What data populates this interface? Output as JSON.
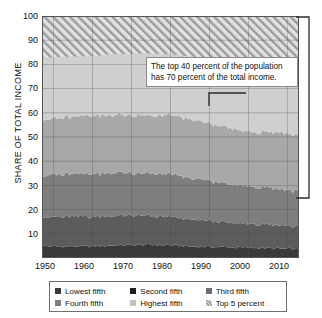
{
  "chart_data": {
    "type": "area",
    "title": "",
    "xlabel": "",
    "ylabel": "SHARE OF TOTAL INCOME",
    "xlim": [
      1947,
      2013
    ],
    "ylim": [
      0,
      100
    ],
    "grid": true,
    "stacked": true,
    "legend_position": "bottom",
    "xticks": [
      1950,
      1960,
      1970,
      1980,
      1990,
      2000,
      2010
    ],
    "yticks": [
      10,
      20,
      30,
      40,
      50,
      60,
      70,
      80,
      90,
      100
    ],
    "x": [
      1947,
      1950,
      1955,
      1960,
      1965,
      1970,
      1975,
      1980,
      1985,
      1990,
      1995,
      2000,
      2005,
      2010,
      2013
    ],
    "series": [
      {
        "name": "Lowest fifth",
        "color": "#3a3a3a",
        "values": [
          5.0,
          4.8,
          4.8,
          4.8,
          5.2,
          5.4,
          5.4,
          5.3,
          4.8,
          4.6,
          4.4,
          4.3,
          4.0,
          3.8,
          3.7
        ]
      },
      {
        "name": "Second fifth",
        "color": "#5c5c5c",
        "values": [
          11.9,
          12.0,
          12.3,
          12.2,
          12.2,
          12.2,
          11.8,
          11.6,
          11.0,
          10.8,
          10.1,
          9.8,
          9.6,
          9.5,
          9.3
        ]
      },
      {
        "name": "Third fifth",
        "color": "#7e7e7e",
        "values": [
          17.0,
          17.4,
          17.8,
          17.8,
          17.8,
          17.6,
          17.6,
          17.6,
          16.9,
          16.6,
          15.8,
          15.4,
          15.3,
          14.8,
          14.6
        ]
      },
      {
        "name": "Fourth fifth",
        "color": "#a8a8a8",
        "values": [
          23.1,
          23.4,
          23.7,
          24.0,
          23.9,
          23.8,
          24.1,
          24.3,
          24.3,
          23.8,
          23.2,
          22.7,
          22.9,
          23.4,
          23.2
        ]
      },
      {
        "name": "Highest fifth",
        "color": "#cfcfcf",
        "values": [
          43.0,
          42.4,
          41.4,
          41.2,
          40.9,
          41.0,
          41.1,
          41.2,
          43.0,
          44.2,
          46.5,
          47.8,
          48.2,
          48.5,
          49.2
        ]
      },
      {
        "name": "Top 5 percent",
        "color": "#d8d8d8",
        "hatched": true,
        "values": [
          17.2,
          17.0,
          16.8,
          16.6,
          15.8,
          15.6,
          15.5,
          15.8,
          16.7,
          17.4,
          18.7,
          20.8,
          21.1,
          21.3,
          22.0
        ]
      }
    ],
    "boundaries_note": "Top 5 percent is a subset shown as hatched band above 83",
    "annotation": {
      "text": "The top 40 percent of the population has 70 percent of the total income.",
      "bracket_from": 30,
      "bracket_to": 100
    }
  },
  "axis": {
    "ylabel": "SHARE OF TOTAL INCOME",
    "yticks": [
      "100",
      "90",
      "80",
      "70",
      "60",
      "50",
      "40",
      "30",
      "20",
      "10"
    ],
    "xticks": [
      "1950",
      "1960",
      "1970",
      "1980",
      "1990",
      "2000",
      "2010"
    ]
  },
  "annotation": {
    "line1": "The top 40 percent of the population",
    "line2": "has 70 percent of the total income."
  },
  "legend": {
    "items": [
      {
        "label": "Lowest fifth",
        "color": "#3a3a3a"
      },
      {
        "label": "Second fifth",
        "color": "#1e1e1e"
      },
      {
        "label": "Third fifth",
        "color": "#6f6f6f"
      },
      {
        "label": "Fourth fifth",
        "color": "#7e7e7e"
      },
      {
        "label": "Highest fifth",
        "color": "#c2c2c2"
      },
      {
        "label": "Top 5 percent",
        "color": "#a9a9a9"
      }
    ]
  }
}
